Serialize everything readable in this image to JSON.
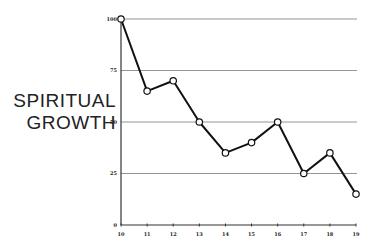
{
  "chart_data": {
    "type": "line",
    "title": "",
    "xlabel": "",
    "ylabel": "SPIRITUAL GROWTH",
    "ylabel_lines": [
      "SPIRITUAL",
      "GROWTH"
    ],
    "x": [
      10,
      11,
      12,
      13,
      14,
      15,
      16,
      17,
      18,
      19
    ],
    "categories": [
      "10",
      "11",
      "12",
      "13",
      "14",
      "15",
      "16",
      "17",
      "18",
      "19"
    ],
    "series": [
      {
        "name": "Spiritual Growth",
        "values": [
          100,
          65,
          70,
          50,
          35,
          40,
          50,
          25,
          35,
          15
        ]
      }
    ],
    "ylim": [
      0,
      100
    ],
    "yticks": [
      0,
      25,
      50,
      75,
      100
    ],
    "xticks": [
      10,
      11,
      12,
      13,
      14,
      15,
      16,
      17,
      18,
      19
    ],
    "grid": true,
    "legend": null,
    "colors": {
      "line": "#111111",
      "grid": "#888888",
      "marker_fill": "#ffffff"
    }
  }
}
